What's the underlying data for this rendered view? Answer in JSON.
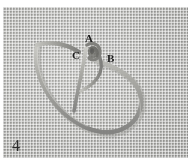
{
  "figure": {
    "number": "4",
    "background_description": "coarse woven burlap fabric",
    "colors": {
      "page_background": "#ffffff",
      "fabric_light": "#d4d4d1",
      "fabric_mid": "#c4c4c1",
      "fabric_dark": "#b4b4b1",
      "cord_light": "#b9b9b4",
      "cord_mid": "#9a9a95",
      "cord_shadow": "#6f6f6b",
      "label_text": "#1a1a1a",
      "figure_number_text": "#2a2a2a"
    }
  },
  "labels": [
    {
      "id": "A",
      "text": "A",
      "x": 87,
      "y": 32
    },
    {
      "id": "C",
      "text": "C",
      "x": 74,
      "y": 49
    },
    {
      "id": "B",
      "text": "B",
      "x": 109,
      "y": 52
    }
  ],
  "annotations": {
    "label_a": "A",
    "label_b": "B",
    "label_c": "C",
    "figure_caption_number": "4"
  }
}
